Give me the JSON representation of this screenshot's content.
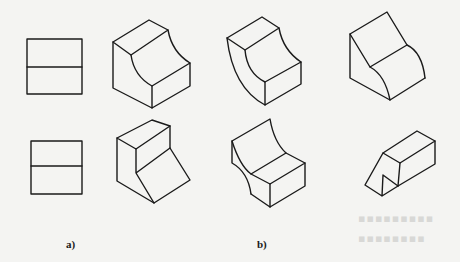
{
  "figure": {
    "labels": {
      "a": "a)",
      "b": "b)"
    },
    "groups": [
      {
        "id": "a",
        "description": "Front views (two rectangles divided horizontally)"
      },
      {
        "id": "b",
        "description": "Isometric solids matching the front views"
      }
    ],
    "line_color": "#1a1a1a",
    "background_color": "#f4f4f2"
  }
}
